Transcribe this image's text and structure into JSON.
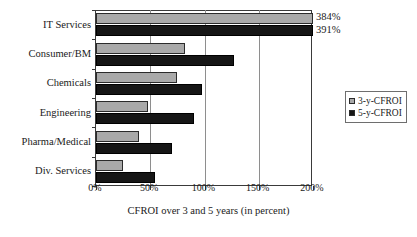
{
  "chart_data": {
    "type": "bar",
    "orientation": "horizontal",
    "title": "",
    "xlabel": "CFROI over 3 and 5 years (in percent)",
    "ylabel": "",
    "xlim": [
      0,
      200
    ],
    "xticks": [
      0,
      50,
      100,
      150,
      200
    ],
    "xtick_labels": [
      "0%",
      "50%",
      "100%",
      "150%",
      "200%"
    ],
    "grid": "vertical",
    "legend_position": "right",
    "categories": [
      "IT Services",
      "Consumer/BM",
      "Chemicals",
      "Engineering",
      "Pharma/Medical",
      "Div. Services"
    ],
    "series": [
      {
        "name": "3-y-CFROI",
        "color": "#a9a9a9",
        "values": [
          384,
          82,
          75,
          48,
          40,
          25
        ]
      },
      {
        "name": "5-y-CFROI",
        "color": "#161616",
        "values": [
          391,
          127,
          98,
          90,
          70,
          54
        ]
      }
    ],
    "annotations": [
      {
        "category": "IT Services",
        "series": "3-y-CFROI",
        "text": "384%"
      },
      {
        "category": "IT Services",
        "series": "5-y-CFROI",
        "text": "391%"
      }
    ]
  },
  "legend": {
    "items": [
      {
        "label": "3-y-CFROI"
      },
      {
        "label": "5-y-CFROI"
      }
    ]
  }
}
